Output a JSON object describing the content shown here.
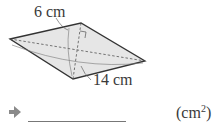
{
  "figure": {
    "shape": "rhombus",
    "fill": "#e6e6e6",
    "stroke": "#333333",
    "short_diagonal_label": "6 cm",
    "long_diagonal_label": "14 cm"
  },
  "answer": {
    "value": "",
    "unit_base": "(cm",
    "unit_exp": "2",
    "unit_close": ")",
    "arrow_color": "#8a8a8a"
  }
}
